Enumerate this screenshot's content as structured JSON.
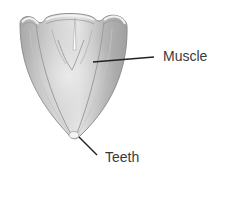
{
  "diagram": {
    "colors": {
      "background": "#ffffff",
      "body_fill": "#b9b9b9",
      "body_light": "#e2e2e2",
      "body_edge": "#8e8e8e",
      "leader_line": "#222222",
      "label_text": "#3a3a3a"
    },
    "labels": [
      {
        "id": "muscle",
        "text": "Muscle"
      },
      {
        "id": "teeth",
        "text": "Teeth"
      }
    ]
  }
}
